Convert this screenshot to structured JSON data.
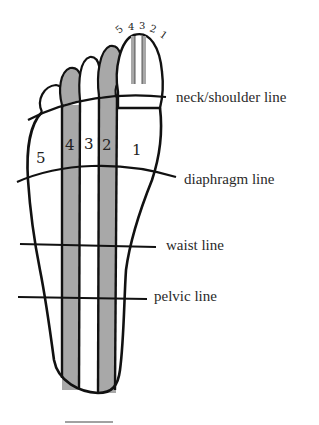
{
  "colors": {
    "zone_fill": "#a8a8a8",
    "outline": "#111111",
    "background": "#ffffff"
  },
  "toe_zone_numbers": [
    "5",
    "4",
    "3",
    "2",
    "1"
  ],
  "zone_numbers": [
    {
      "label": "5",
      "x": 42,
      "y": 162
    },
    {
      "label": "4",
      "x": 70,
      "y": 150
    },
    {
      "label": "3",
      "x": 89,
      "y": 148
    },
    {
      "label": "2",
      "x": 107,
      "y": 150
    },
    {
      "label": "1",
      "x": 135,
      "y": 154
    }
  ],
  "lines": [
    {
      "label": "neck/shoulder line",
      "label_x": 176,
      "label_y": 89
    },
    {
      "label": "diaphragm line",
      "label_x": 184,
      "label_y": 170
    },
    {
      "label": "waist line",
      "label_x": 166,
      "label_y": 236
    },
    {
      "label": "pelvic line",
      "label_x": 154,
      "label_y": 286
    }
  ]
}
